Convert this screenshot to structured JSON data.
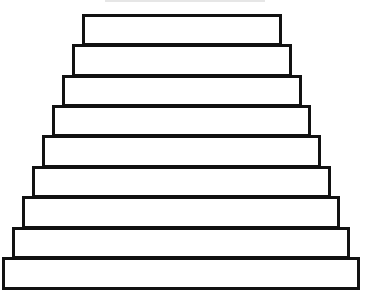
{
  "diagram": {
    "type": "stepped-pyramid",
    "stroke_color": "#111111",
    "fill_color": "#ffffff",
    "background_color": "#ffffff",
    "tier_count": 9,
    "tiers": [
      {
        "index": 1,
        "left": 82,
        "top": 14,
        "right": 282,
        "bottom": 46
      },
      {
        "index": 2,
        "left": 72,
        "top": 44,
        "right": 292,
        "bottom": 77
      },
      {
        "index": 3,
        "left": 62,
        "top": 75,
        "right": 302,
        "bottom": 107
      },
      {
        "index": 4,
        "left": 52,
        "top": 105,
        "right": 311,
        "bottom": 137
      },
      {
        "index": 5,
        "left": 42,
        "top": 135,
        "right": 321,
        "bottom": 168
      },
      {
        "index": 6,
        "left": 32,
        "top": 166,
        "right": 331,
        "bottom": 198
      },
      {
        "index": 7,
        "left": 22,
        "top": 196,
        "right": 340,
        "bottom": 229
      },
      {
        "index": 8,
        "left": 12,
        "top": 227,
        "right": 350,
        "bottom": 259
      },
      {
        "index": 9,
        "left": 2,
        "top": 257,
        "right": 360,
        "bottom": 290
      }
    ]
  }
}
